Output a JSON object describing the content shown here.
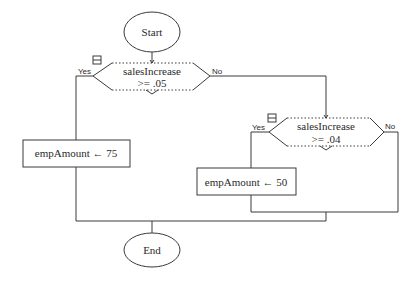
{
  "diagram": {
    "type": "flowchart",
    "start": {
      "label": "Start"
    },
    "end": {
      "label": "End"
    },
    "decision1": {
      "line1": "salesIncrease",
      "line2": ">= .05",
      "yes_label": "Yes",
      "no_label": "No"
    },
    "decision2": {
      "line1": "salesIncrease",
      "line2": ">= .04",
      "yes_label": "Yes",
      "no_label": "No"
    },
    "process1": {
      "label": "empAmount ← 75"
    },
    "process2": {
      "label": "empAmount ← 50"
    }
  }
}
